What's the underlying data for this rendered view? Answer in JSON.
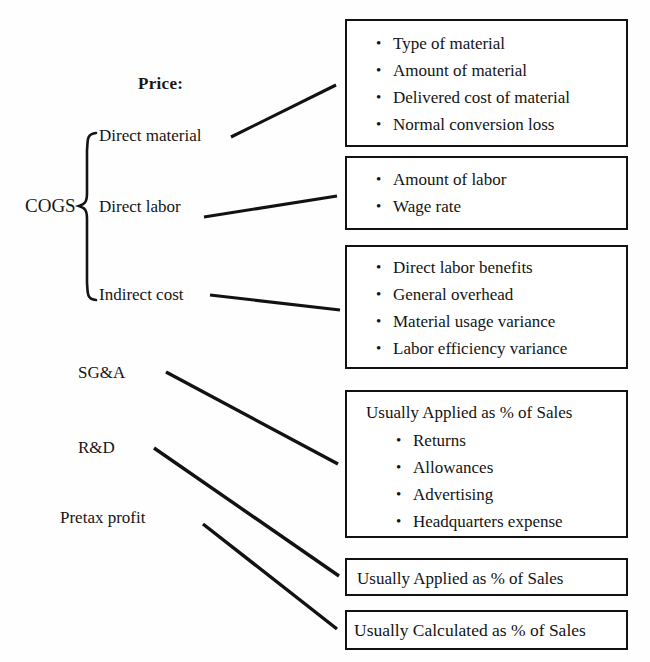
{
  "diagram": {
    "title_label": "Price:",
    "root_label": "COGS",
    "type": "tree-to-boxes flowchart"
  },
  "branches": [
    {
      "id": "direct-material",
      "label": "Direct material",
      "under_brace": true
    },
    {
      "id": "direct-labor",
      "label": "Direct labor",
      "under_brace": true
    },
    {
      "id": "indirect-cost",
      "label": "Indirect cost",
      "under_brace": true
    },
    {
      "id": "sga",
      "label": "SG&A",
      "under_brace": false
    },
    {
      "id": "rd",
      "label": "R&D",
      "under_brace": false
    },
    {
      "id": "pretax-profit",
      "label": "Pretax profit",
      "under_brace": false
    }
  ],
  "boxes": [
    {
      "id": "material",
      "source": "Direct material",
      "headline": "",
      "items": [
        "Type of material",
        "Amount of material",
        "Delivered cost of material",
        "Normal conversion loss"
      ]
    },
    {
      "id": "labor",
      "source": "Direct labor",
      "headline": "",
      "items": [
        "Amount of labor",
        "Wage rate"
      ]
    },
    {
      "id": "indirect",
      "source": "Indirect cost",
      "headline": "",
      "items": [
        "Direct labor benefits",
        "General overhead",
        "Material usage variance",
        "Labor efficiency variance"
      ]
    },
    {
      "id": "sga",
      "source": "SG&A",
      "headline": "Usually Applied as % of Sales",
      "items": [
        "Returns",
        "Allowances",
        "Advertising",
        "Headquarters expense"
      ]
    },
    {
      "id": "rd",
      "source": "R&D",
      "headline": "Usually Applied as % of Sales",
      "items": []
    },
    {
      "id": "pretax",
      "source": "Pretax profit",
      "headline": "Usually Calculated as % of Sales",
      "items": []
    }
  ],
  "glyphs": {
    "bullet": "•"
  },
  "colors": {
    "ink": "#121212",
    "paper": "#fefefe"
  }
}
